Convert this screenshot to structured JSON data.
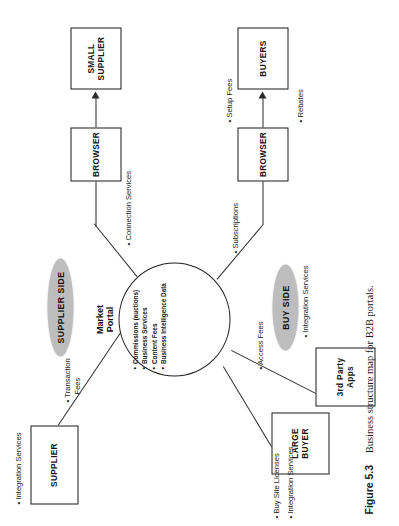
{
  "figure": {
    "number": "Figure 5.3",
    "caption": "Business structure map for B2B portals."
  },
  "diagram": {
    "type": "business-structure-map",
    "center": {
      "title_line1": "Market",
      "title_line2": "Portal",
      "items": [
        "Commissions (auctions)",
        "Business Services",
        "Content Fees",
        "Business Intelligence Data"
      ]
    },
    "zones": [
      {
        "id": "supplier-side",
        "label": "SUPPLIER SIDE"
      },
      {
        "id": "buy-side",
        "label": "BUY SIDE"
      }
    ],
    "nodes": [
      {
        "id": "supplier",
        "label": "SUPPLIER"
      },
      {
        "id": "browser-top",
        "label": "BROWSER"
      },
      {
        "id": "small-supplier",
        "label_line1": "SMALL",
        "label_line2": "SUPPLIER"
      },
      {
        "id": "large-buyer",
        "label_line1": "LARGE",
        "label_line2": "BUYER"
      },
      {
        "id": "third-party",
        "label_line1": "3rd Party",
        "label_line2": "Apps"
      },
      {
        "id": "browser-bottom",
        "label": "BROWSER"
      },
      {
        "id": "buyers",
        "label": "BUYERS"
      }
    ],
    "annotations": [
      {
        "id": "supplier-integration-services",
        "text": "Integration Services"
      },
      {
        "id": "transaction-fees",
        "line1": "Transaction",
        "line2": "Fees"
      },
      {
        "id": "connection-services",
        "text": "Connection Services"
      },
      {
        "id": "subscriptions",
        "text": "Subscriptions"
      },
      {
        "id": "access-fees",
        "text": "Access Fees"
      },
      {
        "id": "buyer-integration-services",
        "text": "Integration Services"
      },
      {
        "id": "buy-site-licenses",
        "text": "Buy Site Licenses"
      },
      {
        "id": "large-buyer-integration-services",
        "text": "Integration Services"
      },
      {
        "id": "setup-fees",
        "text": "Setup Fees"
      },
      {
        "id": "rebates",
        "text": "Rebates"
      }
    ],
    "bullet_glyph": "•",
    "colors": {
      "ink": "#1b1b1b",
      "zone_fill": "#bdbdbd",
      "paper": "#ffffff"
    }
  }
}
